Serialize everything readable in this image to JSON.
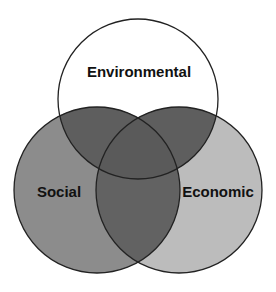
{
  "diagram": {
    "type": "venn",
    "sets": [
      {
        "id": "environmental",
        "label": "Environmental",
        "fill": "#ffffff"
      },
      {
        "id": "social",
        "label": "Social",
        "fill": "#8c8c8c"
      },
      {
        "id": "economic",
        "label": "Economic",
        "fill": "#bcbcbc"
      }
    ],
    "overlaps": {
      "environmental_social": "#5e5e5e",
      "environmental_economic": "#5e5e5e",
      "social_economic": "#626262",
      "all_three": "#5a5a5a"
    },
    "stroke": "#222222"
  }
}
